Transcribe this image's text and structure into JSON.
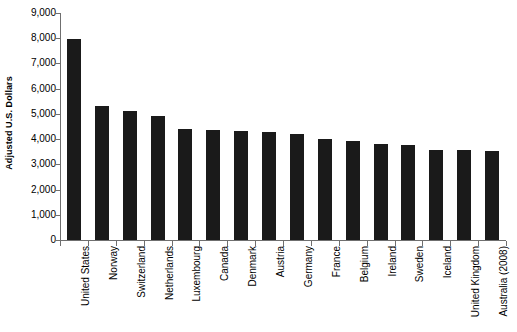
{
  "chart_data": {
    "type": "bar",
    "title": "",
    "xlabel": "",
    "ylabel": "Adjusted U.S. Dollars",
    "ylim": [
      0,
      9000
    ],
    "ytick_values": [
      0,
      1000,
      2000,
      3000,
      4000,
      5000,
      6000,
      7000,
      8000,
      9000
    ],
    "ytick_labels": [
      "0",
      "1,000",
      "2,000",
      "3,000",
      "4,000",
      "5,000",
      "6,000",
      "7,000",
      "8,000",
      "9,000"
    ],
    "grid": false,
    "legend": null,
    "bar_color": "#1a1a1a",
    "axis_color": "#6f6f6f",
    "categories": [
      "United States",
      "Norway",
      "Switzerland",
      "Netherlands",
      "Luxembourg",
      "Canada",
      "Denmark",
      "Austria",
      "Germany",
      "France",
      "Belgium",
      "Ireland",
      "Sweden",
      "Iceland",
      "United Kingdom",
      "Australia (2008)"
    ],
    "values": [
      7960,
      5330,
      5120,
      4930,
      4420,
      4360,
      4320,
      4280,
      4210,
      4000,
      3940,
      3800,
      3750,
      3580,
      3550,
      3520
    ]
  }
}
